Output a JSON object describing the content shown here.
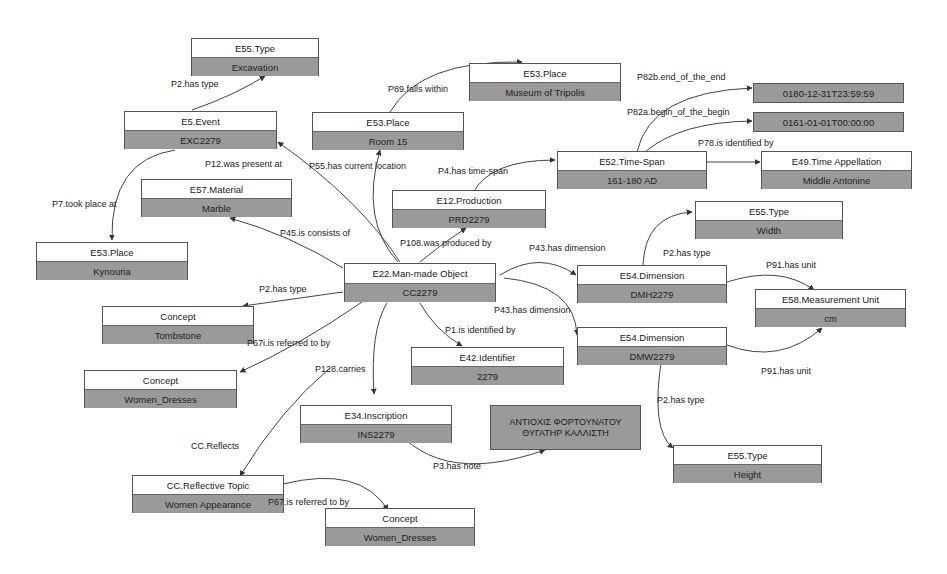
{
  "colors": {
    "header_bg": "#ffffff",
    "value_bg": "#9a9a9a",
    "border": "#555555",
    "edge": "#444444"
  },
  "nodes": {
    "type_excavation": {
      "class": "E55.Type",
      "value": "Excavation"
    },
    "event": {
      "class": "E5.Event",
      "value": "EXC2279"
    },
    "place_room": {
      "class": "E53.Place",
      "value": "Room 15"
    },
    "place_museum": {
      "class": "E53.Place",
      "value": "Museum of Tripolis"
    },
    "material": {
      "class": "E57.Material",
      "value": "Marble"
    },
    "place_kynouria": {
      "class": "E53.Place",
      "value": "Kynouria"
    },
    "production": {
      "class": "E12.Production",
      "value": "PRD2279"
    },
    "timespan": {
      "class": "E52.Time-Span",
      "value": "161-180 AD"
    },
    "end_value": {
      "value": "0180-12-31T23:59:59"
    },
    "begin_value": {
      "value": "0161-01-01T00:00:00"
    },
    "time_appellation": {
      "class": "E49.Time Appellation",
      "value": "Middle Antonine"
    },
    "object": {
      "class": "E22.Man-made Object",
      "value": "CC2279"
    },
    "concept_tombstone": {
      "class": "Concept",
      "value": "Tombstone"
    },
    "concept_dresses_1": {
      "class": "Concept",
      "value": "Women_Dresses"
    },
    "type_width": {
      "class": "E55.Type",
      "value": "Width"
    },
    "dim_h": {
      "class": "E54.Dimension",
      "value": "DMH2279"
    },
    "dim_w": {
      "class": "E54.Dimension",
      "value": "DMW2279"
    },
    "unit": {
      "class": "E58.Measurement Unit",
      "value": "cm"
    },
    "identifier": {
      "class": "E42.Identifier",
      "value": "2279"
    },
    "inscription": {
      "class": "E34.Inscription",
      "value": "INS2279"
    },
    "note": {
      "value": "ΑΝΤΙΟΧΙΣ ΦΟΡΤΟΥΝΑΤΟΥ\nΘΥΓΑΤΗΡ ΚΑΛΛΙΣΤΗ"
    },
    "type_height": {
      "class": "E55.Type",
      "value": "Height"
    },
    "reflective_topic": {
      "class": "CC.Reflective Topic",
      "value": "Women Appearance"
    },
    "concept_dresses_2": {
      "class": "Concept",
      "value": "Women_Dresses"
    }
  },
  "edges": {
    "p2_type_event": "P2.has type",
    "p89": "P89.falls within",
    "p82b": "P82b.end_of_the_end",
    "p82a": "P82a.begin_of_the_begin",
    "p78": "P78.is identified by",
    "p12": "P12.was present at",
    "p55": "P55.has current location",
    "p4": "P4.has time-span",
    "p7": "P7.took place at",
    "p45": "P45.is consists of",
    "p108": "P108.was produced by",
    "p43_h": "P43.has dimension",
    "p2_type_width": "P2.has type",
    "p91_h": "P91.has unit",
    "p2_type_object": "P2.has type",
    "p43_w": "P43.has dimension",
    "p67i": "P67i.is referred to by",
    "p1": "P1.is identified by",
    "p91_w": "P91.has unit",
    "p128": "P128.carries",
    "cc_reflects": "CC.Reflects",
    "p2_type_height": "P2.has type",
    "p3": "P3.has note",
    "p67_topic": "P67.is referred to by"
  }
}
